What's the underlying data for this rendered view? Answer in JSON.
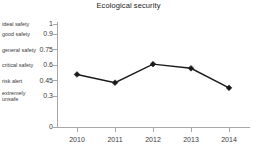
{
  "chart_data": {
    "type": "line",
    "title": "Ecological security",
    "xlabel": "",
    "ylabel": "",
    "categories": [
      "2010",
      "2011",
      "2012",
      "2013",
      "2014"
    ],
    "x": [
      2010,
      2011,
      2012,
      2013,
      2014
    ],
    "values": [
      0.51,
      0.43,
      0.61,
      0.57,
      0.38
    ],
    "series": [
      {
        "name": "Ecological security",
        "values": [
          0.51,
          0.43,
          0.61,
          0.57,
          0.38
        ],
        "color": "#1a1a1a",
        "marker": "diamond"
      }
    ],
    "ylim": [
      0,
      1
    ],
    "y_ticks": [
      0,
      0.3,
      0.45,
      0.6,
      0.75,
      0.9,
      1
    ],
    "y_tick_labels": [
      "0",
      "0.3",
      "0.45",
      "0.6",
      "0.75",
      "0.9",
      "1"
    ],
    "y_category_labels": [
      {
        "label": "ideal safety",
        "value": 1
      },
      {
        "label": "good safety",
        "value": 0.9
      },
      {
        "label": "general safety",
        "value": 0.75
      },
      {
        "label": "critical safety",
        "value": 0.6
      },
      {
        "label": "risk alert",
        "value": 0.45
      },
      {
        "label": "extremely\nunsafe",
        "value": 0.3
      }
    ],
    "grid": false,
    "legend": false,
    "legend_position": "none",
    "axis_color": "#a8a8a8",
    "text_color": "#3a3a3a"
  }
}
